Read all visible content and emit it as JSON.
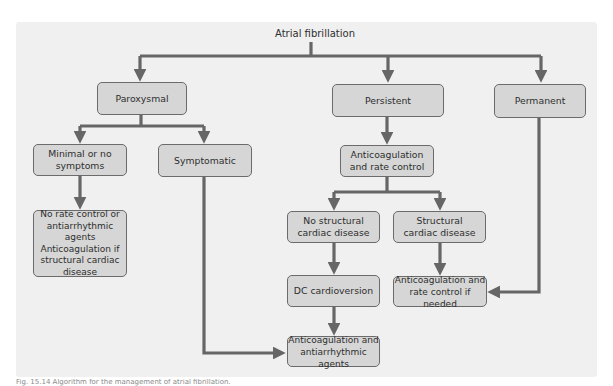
{
  "diagram": {
    "title": "Atrial fibrillation",
    "type": "flowchart",
    "nodes": {
      "paroxysmal": "Paroxysmal",
      "persistent": "Persistent",
      "permanent": "Permanent",
      "minimal_symptoms": "Minimal or no\nsymptoms",
      "symptomatic": "Symptomatic",
      "no_rate_control": "No rate control or\nantiarrhythmic agents\nAnticoagulation if\nstructural cardiac\ndisease",
      "anticoag_rate_control": "Anticoagulation\nand rate control",
      "no_structural": "No structural\ncardiac disease",
      "structural": "Structural\ncardiac disease",
      "dc_cardioversion": "DC cardioversion",
      "anticoag_rate_if_needed": "Anticoagulation and\nrate control if needed",
      "anticoag_antiarrhythmic": "Anticoagulation and\nantiarrhythmic agents"
    },
    "edges": [
      [
        "title",
        "paroxysmal"
      ],
      [
        "title",
        "persistent"
      ],
      [
        "title",
        "permanent"
      ],
      [
        "paroxysmal",
        "minimal_symptoms"
      ],
      [
        "paroxysmal",
        "symptomatic"
      ],
      [
        "minimal_symptoms",
        "no_rate_control"
      ],
      [
        "persistent",
        "anticoag_rate_control"
      ],
      [
        "anticoag_rate_control",
        "no_structural"
      ],
      [
        "anticoag_rate_control",
        "structural"
      ],
      [
        "no_structural",
        "dc_cardioversion"
      ],
      [
        "structural",
        "anticoag_rate_if_needed"
      ],
      [
        "permanent",
        "anticoag_rate_if_needed"
      ],
      [
        "dc_cardioversion",
        "anticoag_antiarrhythmic"
      ],
      [
        "symptomatic",
        "anticoag_antiarrhythmic"
      ]
    ],
    "colors": {
      "panel_bg": "#f0f0f0",
      "node_fill": "#d6d6d6",
      "node_border": "#6b6b6b",
      "connector": "#666666"
    }
  },
  "caption": "Fig. 15.14 Algorithm for the management of atrial fibrillation."
}
